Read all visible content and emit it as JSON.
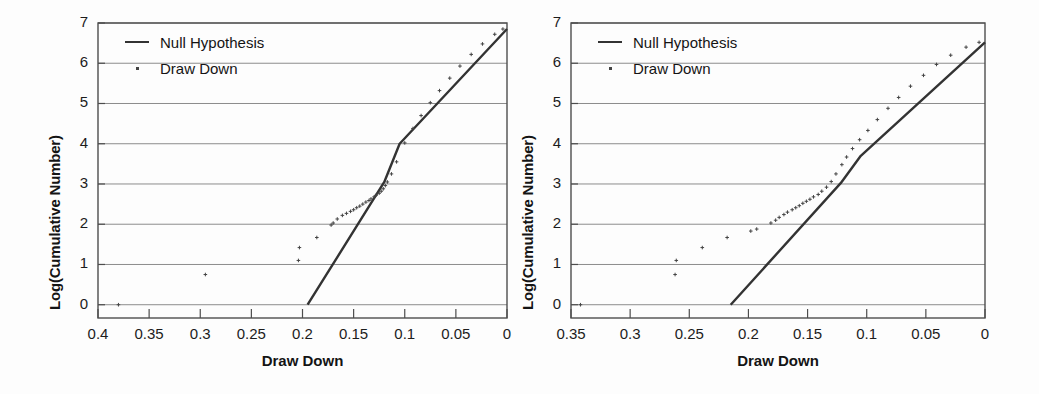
{
  "figure": {
    "panels": [
      {
        "name": "left-panel",
        "ylabel": "Log(Cumulative Number)",
        "xlabel": "Draw Down",
        "legend": [
          {
            "label": "Null Hypothesis",
            "key": "line-key-icon"
          },
          {
            "label": "Draw Down",
            "key": "dot-key-icon"
          }
        ],
        "xticks": [
          "0.4",
          "0.35",
          "0.3",
          "0.25",
          "0.2",
          "0.15",
          "0.1",
          "0.05",
          "0"
        ],
        "yticks": [
          "0",
          "1",
          "2",
          "3",
          "4",
          "5",
          "6",
          "7"
        ]
      },
      {
        "name": "right-panel",
        "ylabel": "Log(Cumulative Number)",
        "xlabel": "Draw Down",
        "legend": [
          {
            "label": "Null Hypothesis",
            "key": "line-key-icon"
          },
          {
            "label": "Draw Down",
            "key": "dot-key-icon"
          }
        ],
        "xticks": [
          "0.35",
          "0.3",
          "0.25",
          "0.2",
          "0.15",
          "0.1",
          "0.05",
          "0"
        ],
        "yticks": [
          "0",
          "1",
          "2",
          "3",
          "4",
          "5",
          "6",
          "7"
        ]
      }
    ],
    "colors": {
      "line": "#333333",
      "points": "#444444",
      "grid": "#8c8c8c",
      "axis": "#4d4d4d",
      "background": "#fdfdfd"
    }
  },
  "chart_data": [
    {
      "type": "scatter",
      "title": "",
      "xlabel": "Draw Down",
      "ylabel": "Log(Cumulative Number)",
      "xlim": [
        0.4,
        0.0
      ],
      "ylim": [
        -0.33,
        7.0
      ],
      "x_axis_reversed": true,
      "grid": true,
      "legend_position": "top-left",
      "xticks": [
        0.4,
        0.35,
        0.3,
        0.25,
        0.2,
        0.15,
        0.1,
        0.05,
        0.0
      ],
      "yticks": [
        0,
        1,
        2,
        3,
        4,
        5,
        6,
        7
      ],
      "series": [
        {
          "name": "Null Hypothesis",
          "type": "line",
          "x": [
            0.195,
            0.12,
            0.105,
            0.0
          ],
          "y": [
            0.0,
            3.05,
            4.0,
            6.85
          ]
        },
        {
          "name": "Draw Down",
          "type": "scatter",
          "x": [
            0.38,
            0.295,
            0.204,
            0.203,
            0.186,
            0.172,
            0.17,
            0.166,
            0.161,
            0.157,
            0.153,
            0.15,
            0.147,
            0.144,
            0.141,
            0.138,
            0.135,
            0.133,
            0.13,
            0.128,
            0.125,
            0.123,
            0.121,
            0.119,
            0.117,
            0.113,
            0.108,
            0.1,
            0.092,
            0.084,
            0.075,
            0.066,
            0.056,
            0.046,
            0.035,
            0.024,
            0.012,
            0.004
          ],
          "y": [
            0.0,
            0.75,
            1.1,
            1.42,
            1.67,
            1.98,
            2.03,
            2.13,
            2.22,
            2.27,
            2.32,
            2.36,
            2.41,
            2.45,
            2.5,
            2.55,
            2.59,
            2.63,
            2.68,
            2.72,
            2.77,
            2.82,
            2.88,
            2.96,
            3.05,
            3.25,
            3.55,
            4.02,
            4.38,
            4.7,
            5.02,
            5.32,
            5.63,
            5.93,
            6.22,
            6.48,
            6.72,
            6.85
          ]
        }
      ]
    },
    {
      "type": "scatter",
      "title": "",
      "xlabel": "Draw Down",
      "ylabel": "Log(Cumulative Number)",
      "xlim": [
        0.35,
        0.0
      ],
      "ylim": [
        -0.33,
        7.0
      ],
      "x_axis_reversed": true,
      "grid": true,
      "legend_position": "top-left",
      "xticks": [
        0.35,
        0.3,
        0.25,
        0.2,
        0.15,
        0.1,
        0.05,
        0.0
      ],
      "yticks": [
        0,
        1,
        2,
        3,
        4,
        5,
        6,
        7
      ],
      "series": [
        {
          "name": "Null Hypothesis",
          "type": "line",
          "x": [
            0.215,
            0.122,
            0.105,
            0.0
          ],
          "y": [
            0.0,
            3.02,
            3.7,
            6.52
          ]
        },
        {
          "name": "Draw Down",
          "type": "scatter",
          "x": [
            0.342,
            0.262,
            0.261,
            0.239,
            0.218,
            0.198,
            0.193,
            0.181,
            0.177,
            0.174,
            0.17,
            0.167,
            0.163,
            0.16,
            0.157,
            0.154,
            0.151,
            0.148,
            0.145,
            0.141,
            0.138,
            0.134,
            0.13,
            0.126,
            0.121,
            0.117,
            0.112,
            0.106,
            0.099,
            0.091,
            0.082,
            0.073,
            0.063,
            0.052,
            0.041,
            0.029,
            0.016,
            0.005
          ],
          "y": [
            0.0,
            0.75,
            1.1,
            1.42,
            1.67,
            1.83,
            1.88,
            2.03,
            2.1,
            2.17,
            2.24,
            2.3,
            2.36,
            2.41,
            2.46,
            2.52,
            2.57,
            2.62,
            2.68,
            2.74,
            2.82,
            2.92,
            3.06,
            3.25,
            3.48,
            3.67,
            3.88,
            4.1,
            4.33,
            4.6,
            4.88,
            5.15,
            5.43,
            5.7,
            5.97,
            6.2,
            6.4,
            6.52
          ]
        }
      ]
    }
  ]
}
